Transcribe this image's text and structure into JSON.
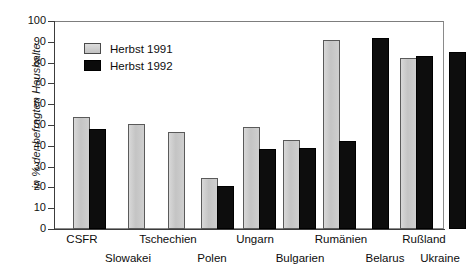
{
  "chart_data": {
    "type": "bar",
    "title": "",
    "subtitle": "",
    "xlabel": "",
    "ylabel": "in % der befragten Haushalte",
    "ylim": [
      0,
      100
    ],
    "ytick_step": 10,
    "yticks": [
      100,
      90,
      80,
      70,
      60,
      50,
      40,
      30,
      20,
      10,
      0
    ],
    "grid": false,
    "legend_position": "inside-top-left",
    "categories": [
      "CSFR",
      "Slowakei",
      "Tschechien",
      "Polen",
      "Ungarn",
      "Bulgarien",
      "Rumänien",
      "Belarus",
      "Rußland",
      "Ukraine"
    ],
    "series": [
      {
        "name": "Herbst 1991",
        "color": "#c9c9c9",
        "values": [
          54,
          50.5,
          46.5,
          24.5,
          49,
          43,
          91,
          null,
          82,
          null
        ]
      },
      {
        "name": "Herbst 1992",
        "color": "#0d0d0d",
        "values": [
          48,
          null,
          null,
          20.5,
          38.5,
          39,
          42.5,
          92,
          83,
          85
        ]
      }
    ],
    "bars": [
      {
        "category": "CSFR",
        "series": "Herbst 1991",
        "value": 54,
        "slot": 0
      },
      {
        "category": "CSFR",
        "series": "Herbst 1992",
        "value": 48,
        "slot": 1
      },
      {
        "category": "Slowakei",
        "series": "Herbst 1991",
        "value": 50.5,
        "slot": 2
      },
      {
        "category": "Tschechien",
        "series": "Herbst 1991",
        "value": 46.5,
        "slot": 3
      },
      {
        "category": "Polen",
        "series": "Herbst 1991",
        "value": 24.5,
        "slot": 4
      },
      {
        "category": "Polen",
        "series": "Herbst 1992",
        "value": 20.5,
        "slot": 5
      },
      {
        "category": "Ungarn",
        "series": "Herbst 1991",
        "value": 49,
        "slot": 6
      },
      {
        "category": "Ungarn",
        "series": "Herbst 1992",
        "value": 38.5,
        "slot": 7
      },
      {
        "category": "Bulgarien",
        "series": "Herbst 1991",
        "value": 43,
        "slot": 8
      },
      {
        "category": "Bulgarien",
        "series": "Herbst 1992",
        "value": 39,
        "slot": 9
      },
      {
        "category": "Rumänien",
        "series": "Herbst 1991",
        "value": 91,
        "slot": 10
      },
      {
        "category": "Rumänien",
        "series": "Herbst 1992",
        "value": 42.5,
        "slot": 11
      },
      {
        "category": "Belarus",
        "series": "Herbst 1992",
        "value": 92,
        "slot": 12
      },
      {
        "category": "Rußland",
        "series": "Herbst 1991",
        "value": 82,
        "slot": 13
      },
      {
        "category": "Rußland",
        "series": "Herbst 1992",
        "value": 83,
        "slot": 14
      },
      {
        "category": "Ukraine",
        "series": "Herbst 1992",
        "value": 85,
        "slot": 15
      }
    ]
  },
  "axis": {
    "y_title": "in % der befragten Haushalte",
    "tick_labels": [
      "100",
      "90",
      "80",
      "70",
      "60",
      "50",
      "40",
      "30",
      "20",
      "10",
      "0"
    ]
  },
  "legend": {
    "entries": [
      {
        "label": "Herbst 1991",
        "swatch": "legend-swatch-1991"
      },
      {
        "label": "Herbst 1992",
        "swatch": "legend-swatch-1992"
      }
    ]
  },
  "category_labels": {
    "top_row": [
      "CSFR",
      "Tschechien",
      "Ungarn",
      "Rumänien",
      "Rußland"
    ],
    "bottom_row": [
      "Slowakei",
      "Polen",
      "Bulgarien",
      "Belarus",
      "Ukraine"
    ]
  }
}
